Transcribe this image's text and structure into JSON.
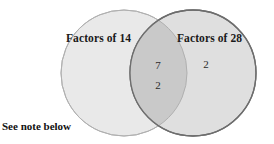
{
  "diagram": {
    "type": "venn-2-set",
    "background_color": "#ffffff",
    "sets": {
      "left": {
        "label": "Factors of 14",
        "fill_color": "#e9e9e9",
        "stroke_color": "#b3b3b3",
        "cx": 124,
        "cy": 73,
        "r": 63
      },
      "right": {
        "label": "Factors of 28",
        "fill_color": "#dedede",
        "stroke_color": "#6d6d6d",
        "cx": 193,
        "cy": 73,
        "r": 63
      },
      "intersection": {
        "fill_color": "#c9c9c9"
      }
    },
    "regions": {
      "left_only": {
        "members": []
      },
      "intersection": {
        "members": [
          "7",
          "2"
        ]
      },
      "right_only": {
        "members": [
          "2"
        ]
      }
    },
    "note": "See note below"
  }
}
